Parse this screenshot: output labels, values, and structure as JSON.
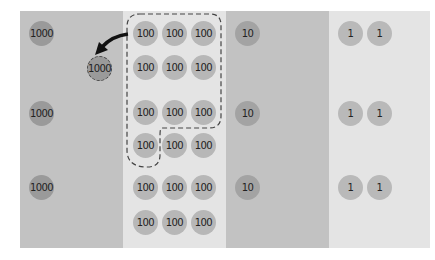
{
  "diagram": {
    "columns": [
      {
        "name": "thousands",
        "value_label": "1000",
        "color": "#c2c2c2"
      },
      {
        "name": "hundreds",
        "value_label": "100",
        "color": "#e4e4e4"
      },
      {
        "name": "tens",
        "value_label": "10",
        "color": "#c2c2c2"
      },
      {
        "name": "ones",
        "value_label": "1",
        "color": "#e4e4e4"
      }
    ],
    "thousands": [
      "1000",
      "1000",
      "1000"
    ],
    "moved_disc": "1000",
    "hundreds": [
      [
        "100",
        "100",
        "100"
      ],
      [
        "100",
        "100",
        "100"
      ],
      [
        "100",
        "100",
        "100"
      ],
      [
        "100",
        "100",
        "100"
      ],
      [
        "100",
        "100",
        "100"
      ],
      [
        "100",
        "100",
        "100"
      ]
    ],
    "tens": [
      "10",
      "10",
      "10"
    ],
    "ones": [
      [
        "1",
        "1"
      ],
      [
        "1",
        "1"
      ],
      [
        "1",
        "1"
      ]
    ],
    "annotation": "ten 100-discs grouped (dashed outline) and exchanged for one 1000-disc (arrow)"
  }
}
